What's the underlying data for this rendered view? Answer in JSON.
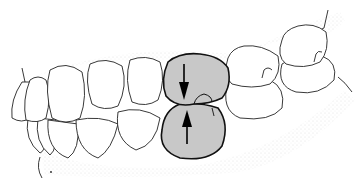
{
  "diagram": {
    "highlighted_tooth_pair": {
      "fill": "#c8c8c8",
      "outline": "#111111",
      "arrows": [
        {
          "direction": "down",
          "label": "upper-force-arrow"
        },
        {
          "direction": "up",
          "label": "lower-force-arrow"
        }
      ]
    },
    "colors": {
      "background": "#ffffff",
      "tooth_fill": "#ffffff",
      "tooth_outline": "#222222",
      "gum_stipple": "#e4e4e4",
      "highlight_fill": "#c8c8c8"
    }
  }
}
